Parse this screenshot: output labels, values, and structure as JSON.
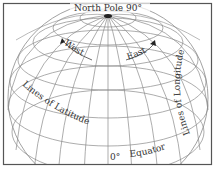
{
  "diagram": {
    "labels": {
      "north_pole": "North Pole 90°",
      "west": "West",
      "east": "East",
      "latitude": "Lines of Latitude",
      "longitude": "Lines of Longitude",
      "equator_degree": "0°",
      "equator": "Equator"
    },
    "colors": {
      "grid": "#8a8a8a",
      "frame": "#555555",
      "text": "#333333",
      "background": "#ffffff"
    }
  }
}
